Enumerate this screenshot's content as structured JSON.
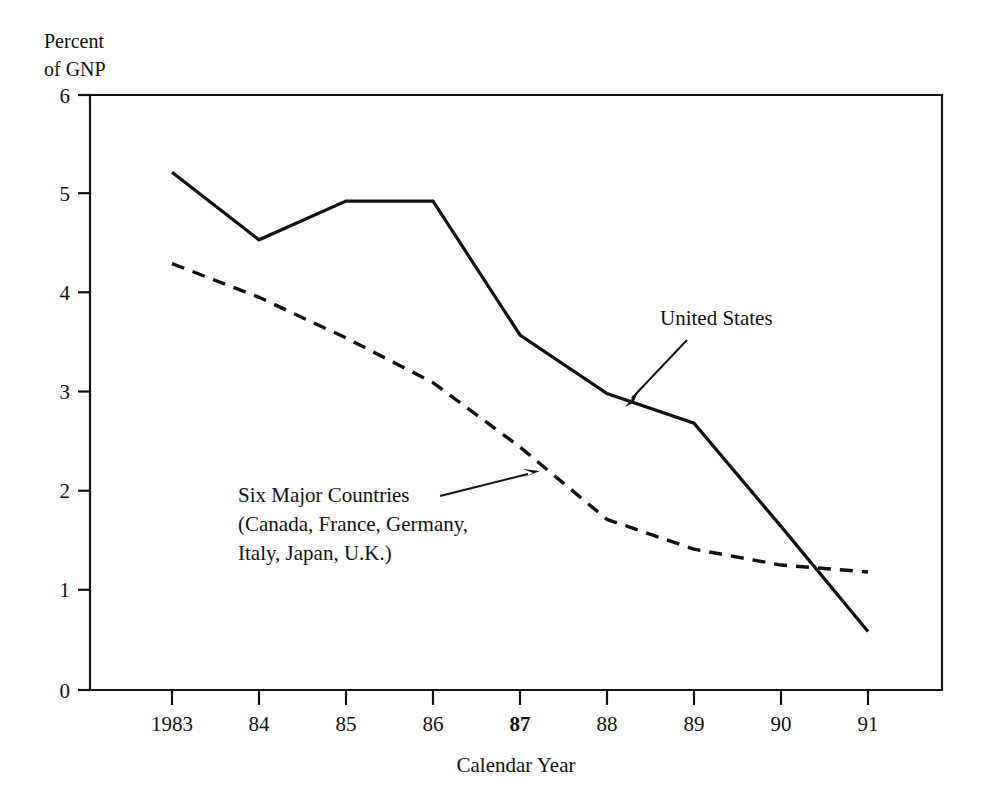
{
  "chart_data": {
    "type": "line",
    "title": "",
    "subtitle": "",
    "xlabel": "Calendar Year",
    "ylabel": "Percent of GNP",
    "ylabel_line1": "Percent",
    "ylabel_line2": "of GNP",
    "x": [
      1983,
      1984,
      1985,
      1986,
      1987,
      1988,
      1989,
      1990,
      1991
    ],
    "categories": [
      "1983",
      "84",
      "85",
      "86",
      "87",
      "88",
      "89",
      "90",
      "91"
    ],
    "xtick_labels": [
      "1983",
      "84",
      "85",
      "86",
      "87",
      "88",
      "89",
      "90",
      "91"
    ],
    "ytick_labels": [
      "0",
      "1",
      "2",
      "3",
      "4",
      "5",
      "6"
    ],
    "ytick_values": [
      0,
      1,
      2,
      3,
      4,
      5,
      6
    ],
    "ylim": [
      0,
      6
    ],
    "xlim": [
      1982.05,
      1991.85
    ],
    "grid": false,
    "legend_position": "inline-annotations",
    "series": [
      {
        "name": "United States",
        "style": "solid",
        "color": "#111111",
        "values": [
          5.22,
          4.54,
          4.93,
          4.93,
          3.58,
          2.99,
          2.69,
          1.65,
          0.59
        ]
      },
      {
        "name": "Six Major Countries (Canada, France, Germany, Italy, Japan, U.K.)",
        "style": "dashed",
        "color": "#111111",
        "values": [
          4.3,
          3.96,
          3.55,
          3.1,
          2.45,
          1.72,
          1.42,
          1.26,
          1.19
        ]
      }
    ],
    "annotations": [
      {
        "id": "united-states",
        "text": "United States",
        "text_x": 660,
        "text_y": 325,
        "arrow_from_x": 687,
        "arrow_from_y": 340,
        "arrow_to_x": 627,
        "arrow_to_y": 404
      },
      {
        "id": "six-major-countries",
        "line1": "Six Major Countries",
        "line2": "(Canada, France, Germany,",
        "line3": "Italy, Japan, U.K.)",
        "text_x": 238,
        "text_y": 502,
        "arrow_from_x": 440,
        "arrow_from_y": 496,
        "arrow_to_x": 536,
        "arrow_to_y": 472
      }
    ],
    "crossover_note": "The solid United States line crosses below the dashed Six Major Countries line between 1990 and 1991."
  },
  "plot_geometry": {
    "left": 90,
    "right": 942,
    "top": 95,
    "bottom": 690
  }
}
